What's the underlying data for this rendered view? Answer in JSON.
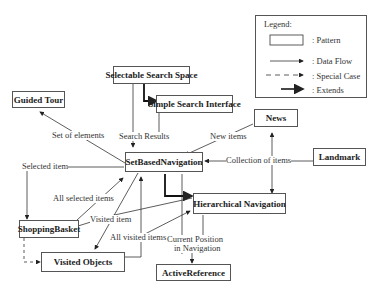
{
  "legend": {
    "title": "Legend:",
    "items": [
      {
        "label": ": Pattern",
        "symbol": "box"
      },
      {
        "label": ": Data Flow",
        "symbol": "solid-arrow"
      },
      {
        "label": ": Special Case",
        "symbol": "dashed-arrow"
      },
      {
        "label": ": Extends",
        "symbol": "thick-arrow"
      }
    ]
  },
  "nodes": {
    "selectable_search_space": "Selectable Search Space",
    "simple_search_interface": "Simple Search Interface",
    "guided_tour": "Guided Tour",
    "news": "News",
    "set_based_navigation": "SetBasedNavigation",
    "landmark": "Landmark",
    "hierarchical_navigation": "Hierarchical Navigation",
    "shopping_basket": "ShoppingBasket",
    "visited_objects": "Visited Objects",
    "active_reference": "ActiveReference"
  },
  "edges": {
    "set_of_elements": "Set of elements",
    "search_results": "Search Results",
    "new_items": "New items",
    "selected_item": "Selected item",
    "collection_of_items": "Collection of items",
    "all_selected_items": "All selected items",
    "visited_item": "Visited item",
    "all_visited_items": "All visited items",
    "current_position_1": "Current Position",
    "current_position_2": "in Navigation"
  }
}
